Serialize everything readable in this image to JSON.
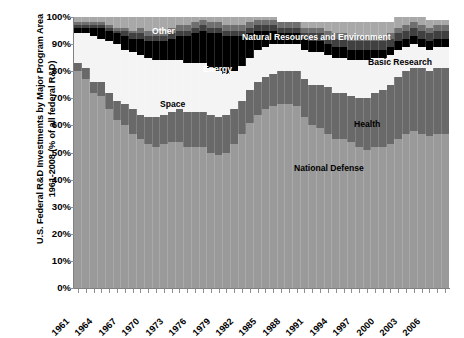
{
  "axis": {
    "y_title_line1": "U.S. Federal R&D Investments by Major Program Area",
    "y_title_line2": "1961-2008 (% of all federal R&D)",
    "y_ticks": [
      "100%",
      "90%",
      "80%",
      "70%",
      "60%",
      "50%",
      "40%",
      "30%",
      "20%",
      "10%",
      "0%"
    ],
    "x_ticks": [
      "1961",
      "1964",
      "1967",
      "1970",
      "1973",
      "1976",
      "1979",
      "1982",
      "1985",
      "1988",
      "1991",
      "1994",
      "1997",
      "2000",
      "2003",
      "2006"
    ]
  },
  "series_labels": [
    {
      "name": "Other",
      "color": "#ffffff"
    },
    {
      "name": "Natural Resources and Environment",
      "color": "#ffffff"
    },
    {
      "name": "Energy",
      "color": "#ffffff"
    },
    {
      "name": "Basic Research",
      "color": "#000000"
    },
    {
      "name": "Space",
      "color": "#000000"
    },
    {
      "name": "Health",
      "color": "#000000"
    },
    {
      "name": "National Defense",
      "color": "#000000"
    }
  ],
  "chart_data": {
    "type": "area",
    "title": "U.S. Federal R&D Investments by Major Program Area 1961-2008 (% of all federal R&D)",
    "xlabel": "",
    "ylabel": "U.S. Federal R&D Investments by Major Program Area 1961-2008 (% of all federal R&D)",
    "ylim": [
      0,
      100
    ],
    "xlim": [
      1961,
      2008
    ],
    "grid": false,
    "stacked": true,
    "legend": "inline-labels",
    "x": [
      1961,
      1962,
      1963,
      1964,
      1965,
      1966,
      1967,
      1968,
      1969,
      1970,
      1971,
      1972,
      1973,
      1974,
      1975,
      1976,
      1977,
      1978,
      1979,
      1980,
      1981,
      1982,
      1983,
      1984,
      1985,
      1986,
      1987,
      1988,
      1989,
      1990,
      1991,
      1992,
      1993,
      1994,
      1995,
      1996,
      1997,
      1998,
      1999,
      2000,
      2001,
      2002,
      2003,
      2004,
      2005,
      2006,
      2007,
      2008
    ],
    "series": [
      {
        "name": "National Defense",
        "color": "#9a9a9a",
        "values": [
          80,
          77,
          72,
          71,
          66,
          62,
          60,
          57,
          55,
          53,
          52,
          53,
          54,
          54,
          52,
          52,
          52,
          50,
          49,
          50,
          53,
          57,
          61,
          64,
          66,
          67,
          68,
          68,
          67,
          63,
          60,
          59,
          57,
          55,
          55,
          54,
          52,
          51,
          52,
          52,
          53,
          55,
          57,
          58,
          57,
          56,
          57,
          57
        ]
      },
      {
        "name": "Health",
        "color": "#696969",
        "values": [
          3,
          4,
          4,
          5,
          6,
          7,
          8,
          9,
          9,
          10,
          11,
          11,
          11,
          12,
          13,
          13,
          13,
          14,
          14,
          14,
          13,
          12,
          12,
          12,
          12,
          12,
          12,
          12,
          13,
          14,
          15,
          16,
          17,
          17,
          17,
          17,
          18,
          19,
          20,
          21,
          22,
          23,
          23,
          23,
          24,
          24,
          24,
          24
        ]
      },
      {
        "name": "Space",
        "color": "#f4f4f4",
        "values": [
          11,
          13,
          17,
          16,
          19,
          21,
          20,
          21,
          22,
          22,
          21,
          20,
          19,
          18,
          18,
          18,
          18,
          17,
          17,
          15,
          14,
          13,
          12,
          12,
          11,
          11,
          10,
          10,
          10,
          11,
          12,
          12,
          12,
          13,
          13,
          13,
          14,
          14,
          13,
          12,
          11,
          10,
          9,
          9,
          8,
          8,
          8,
          8
        ]
      },
      {
        "name": "Energy",
        "color": "#000000",
        "values": [
          2,
          2,
          3,
          4,
          4,
          4,
          5,
          5,
          6,
          6,
          7,
          7,
          8,
          9,
          10,
          11,
          12,
          13,
          14,
          14,
          13,
          11,
          9,
          7,
          6,
          5,
          4,
          4,
          4,
          4,
          4,
          4,
          4,
          4,
          4,
          4,
          4,
          4,
          3,
          3,
          3,
          3,
          3,
          3,
          3,
          3,
          3,
          3
        ]
      },
      {
        "name": "Basic Research",
        "color": "#404040",
        "values": [
          1,
          1,
          1,
          1,
          1,
          1,
          2,
          2,
          2,
          2,
          2,
          2,
          2,
          2,
          2,
          2,
          2,
          2,
          2,
          2,
          2,
          2,
          2,
          2,
          2,
          2,
          2,
          2,
          2,
          2,
          3,
          3,
          3,
          3,
          3,
          3,
          3,
          3,
          3,
          3,
          3,
          3,
          3,
          3,
          3,
          3,
          3,
          3
        ]
      },
      {
        "name": "Natural Resources and Environment",
        "color": "#6f6f6f",
        "values": [
          1,
          1,
          1,
          1,
          1,
          1,
          1,
          1,
          2,
          2,
          2,
          2,
          2,
          2,
          2,
          2,
          2,
          2,
          2,
          2,
          2,
          2,
          2,
          2,
          2,
          2,
          2,
          2,
          2,
          2,
          2,
          2,
          2,
          2,
          2,
          2,
          2,
          2,
          2,
          2,
          2,
          2,
          2,
          2,
          2,
          2,
          2,
          2
        ]
      },
      {
        "name": "Other",
        "color": "#a8a8a8",
        "values": [
          2,
          2,
          2,
          2,
          3,
          4,
          4,
          5,
          4,
          5,
          5,
          5,
          4,
          3,
          3,
          2,
          1,
          2,
          2,
          3,
          3,
          3,
          2,
          1,
          1,
          1,
          0,
          0,
          0,
          2,
          2,
          2,
          3,
          4,
          4,
          5,
          5,
          5,
          5,
          5,
          4,
          4,
          3,
          2,
          3,
          3,
          2,
          2
        ]
      }
    ]
  }
}
